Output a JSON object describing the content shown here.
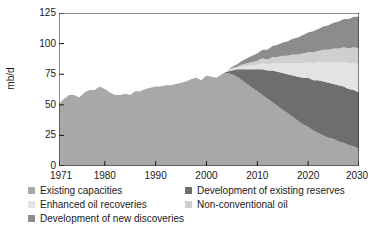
{
  "chart_data": {
    "type": "area",
    "stacked": true,
    "title": "",
    "subtitle": "",
    "xlabel": "",
    "ylabel": "mb/d",
    "xlim": [
      1971,
      2030
    ],
    "ylim": [
      0,
      125
    ],
    "yticks": [
      0,
      25,
      50,
      75,
      100,
      125
    ],
    "xticks": [
      1971,
      1980,
      1990,
      2000,
      2010,
      2020,
      2030
    ],
    "grid": false,
    "legend_position": "below",
    "annotations": [],
    "x": [
      1971,
      1972,
      1973,
      1974,
      1975,
      1976,
      1977,
      1978,
      1979,
      1980,
      1981,
      1982,
      1983,
      1984,
      1985,
      1986,
      1987,
      1988,
      1989,
      1990,
      1991,
      1992,
      1993,
      1994,
      1995,
      1996,
      1997,
      1998,
      1999,
      2000,
      2001,
      2002,
      2003,
      2004,
      2005,
      2006,
      2007,
      2008,
      2009,
      2010,
      2011,
      2012,
      2013,
      2014,
      2015,
      2016,
      2017,
      2018,
      2019,
      2020,
      2021,
      2022,
      2023,
      2024,
      2025,
      2026,
      2027,
      2028,
      2029,
      2030
    ],
    "series": [
      {
        "name": "Existing capacities",
        "color": "#a8a8a8",
        "values": [
          51,
          55,
          58,
          58,
          56,
          60,
          62,
          62,
          65,
          63,
          60,
          58,
          58,
          59,
          58,
          61,
          61,
          63,
          64,
          65,
          65,
          66,
          66,
          67,
          68,
          69,
          71,
          72,
          70,
          74,
          73,
          72,
          75,
          76,
          75,
          73,
          70,
          67,
          64,
          61,
          58,
          55,
          52,
          49,
          46,
          43,
          40,
          37,
          34,
          32,
          29,
          27,
          25,
          23,
          22,
          20,
          19,
          17,
          16,
          14
        ]
      },
      {
        "name": "Development of existing reserves",
        "color": "#6e6e6e",
        "values": [
          0,
          0,
          0,
          0,
          0,
          0,
          0,
          0,
          0,
          0,
          0,
          0,
          0,
          0,
          0,
          0,
          0,
          0,
          0,
          0,
          0,
          0,
          0,
          0,
          0,
          0,
          0,
          0,
          0,
          0,
          0,
          0,
          0,
          1,
          3,
          6,
          9,
          12,
          15,
          18,
          21,
          23,
          26,
          28,
          30,
          32,
          34,
          36,
          38,
          40,
          41,
          43,
          44,
          45,
          45,
          46,
          46,
          46,
          46,
          46
        ]
      },
      {
        "name": "Enhanced oil recoveries",
        "color": "#e3e3e3",
        "values": [
          0,
          0,
          0,
          0,
          0,
          0,
          0,
          0,
          0,
          0,
          0,
          0,
          0,
          0,
          0,
          0,
          0,
          0,
          0,
          0,
          0,
          0,
          0,
          0,
          0,
          0,
          0,
          0,
          0,
          0,
          0,
          0,
          0,
          0,
          1,
          1,
          2,
          3,
          3,
          4,
          5,
          5,
          6,
          7,
          8,
          9,
          10,
          11,
          12,
          13,
          14,
          15,
          16,
          17,
          18,
          19,
          20,
          21,
          22,
          23
        ]
      },
      {
        "name": "Non-conventional oil",
        "color": "#cfcfcf",
        "values": [
          0,
          0,
          0,
          0,
          0,
          0,
          0,
          0,
          0,
          0,
          0,
          0,
          0,
          0,
          0,
          0,
          0,
          0,
          0,
          0,
          0,
          0,
          0,
          0,
          0,
          0,
          0,
          0,
          0,
          0,
          0,
          0,
          0,
          0,
          1,
          1,
          2,
          2,
          3,
          3,
          4,
          4,
          5,
          5,
          6,
          6,
          7,
          7,
          8,
          8,
          9,
          9,
          10,
          10,
          11,
          11,
          12,
          12,
          13,
          13
        ]
      },
      {
        "name": "Development of new discoveries",
        "color": "#8c8c8c",
        "values": [
          0,
          0,
          0,
          0,
          0,
          0,
          0,
          0,
          0,
          0,
          0,
          0,
          0,
          0,
          0,
          0,
          0,
          0,
          0,
          0,
          0,
          0,
          0,
          0,
          0,
          0,
          0,
          0,
          0,
          0,
          0,
          0,
          0,
          0,
          1,
          2,
          3,
          4,
          5,
          6,
          7,
          8,
          9,
          10,
          11,
          12,
          13,
          14,
          15,
          16,
          17,
          18,
          19,
          20,
          21,
          22,
          23,
          24,
          25,
          26
        ]
      }
    ]
  },
  "axes": {
    "ylabel": "mb/d",
    "ytick_labels": [
      "0",
      "25",
      "50",
      "75",
      "100",
      "125"
    ],
    "xtick_labels": [
      "1971",
      "1980",
      "1990",
      "2000",
      "2010",
      "2020",
      "2030"
    ]
  },
  "legend": {
    "items": [
      {
        "label": "Existing capacities",
        "color": "#a8a8a8",
        "col": 0,
        "row": 0
      },
      {
        "label": "Development of existing reserves",
        "color": "#6e6e6e",
        "col": 1,
        "row": 0
      },
      {
        "label": "Enhanced oil recoveries",
        "color": "#e3e3e3",
        "col": 0,
        "row": 1
      },
      {
        "label": "Non-conventional oil",
        "color": "#cfcfcf",
        "col": 1,
        "row": 1
      },
      {
        "label": "Development of new discoveries",
        "color": "#8c8c8c",
        "col": 0,
        "row": 2
      }
    ]
  },
  "style": {
    "axis_color": "#1a1a1a",
    "background": "#ffffff",
    "text_color": "#1a1a1a"
  }
}
